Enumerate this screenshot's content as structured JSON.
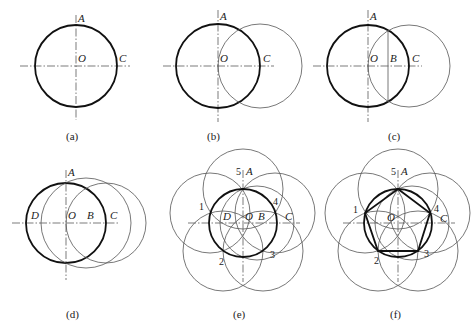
{
  "figure": {
    "panels": [
      {
        "id": "a",
        "caption": "(a)",
        "labels": {
          "A": "A",
          "O": "O",
          "C": "C"
        }
      },
      {
        "id": "b",
        "caption": "(b)",
        "labels": {
          "A": "A",
          "O": "O",
          "C": "C"
        }
      },
      {
        "id": "c",
        "caption": "(c)",
        "labels": {
          "A": "A",
          "O": "O",
          "B": "B",
          "C": "C"
        }
      },
      {
        "id": "d",
        "caption": "(d)",
        "labels": {
          "A": "A",
          "D": "D",
          "O": "O",
          "B": "B",
          "C": "C"
        }
      },
      {
        "id": "e",
        "caption": "(e)",
        "labels": {
          "A": "A",
          "D": "D",
          "O": "O",
          "B": "B",
          "C": "C"
        },
        "vertices": [
          "1",
          "2",
          "3",
          "4",
          "5"
        ]
      },
      {
        "id": "f",
        "caption": "(f)",
        "labels": {
          "A": "A",
          "O": "O",
          "C": "C"
        },
        "vertices": [
          "1",
          "2",
          "3",
          "4",
          "5"
        ]
      }
    ]
  }
}
